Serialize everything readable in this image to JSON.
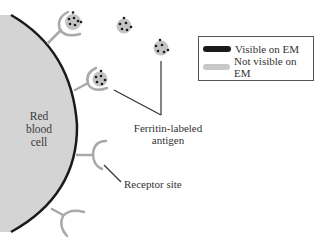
{
  "diagram": {
    "cell_label": [
      "Red",
      "blood",
      "cell"
    ],
    "antigen_label": [
      "Ferritin-labeled",
      "antigen"
    ],
    "receptor_label": "Receptor site"
  },
  "legend": {
    "items": [
      {
        "label": "Visible on EM",
        "color": "#1a1a1a"
      },
      {
        "label": "Not visible on EM",
        "color": "#c8c8c8"
      }
    ]
  },
  "colors": {
    "cell_fill": "#d4d4d4",
    "cell_border": "#1a1a1a",
    "receptor": "#a9a9a9",
    "antigen_fill": "#c4c4c4",
    "ferritin_dot": "#1a1a1a",
    "pointer_line": "#333333"
  }
}
